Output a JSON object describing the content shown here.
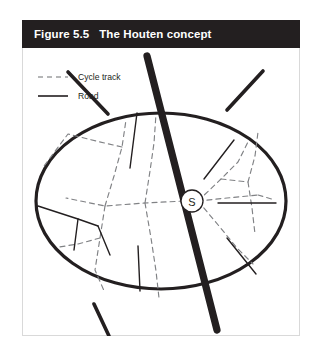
{
  "figure": {
    "caption_number": "Figure 5.5",
    "caption_title": "The Houten concept",
    "caption_full": "Figure 5.5   The Houten concept",
    "caption_bar_color": "#231f20",
    "caption_text_color": "#ffffff",
    "box_border_color": "#d9d9d9",
    "background_color": "#ffffff"
  },
  "legend": {
    "items": [
      {
        "label": "Cycle track",
        "style": "dashed",
        "color": "#6d6e71",
        "swatch_name": "cycle-track-swatch"
      },
      {
        "label": "Road",
        "style": "solid",
        "color": "#231f20",
        "swatch_name": "road-swatch"
      }
    ]
  },
  "diagram": {
    "center_marker_label": "S",
    "center_marker_name": "station-marker",
    "boundary_name": "town-boundary-ellipse",
    "boundary_color": "#231f20",
    "main_road_name": "main-through-road",
    "main_road_color": "#231f20",
    "road_color": "#231f20",
    "cycle_track_color": "#808285"
  }
}
